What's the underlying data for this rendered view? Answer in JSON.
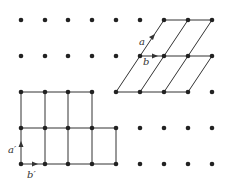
{
  "diagram": {
    "colors": {
      "dot": "#222222",
      "line": "#333333",
      "background": "#ffffff"
    },
    "grid": {
      "columns_x": [
        21,
        45,
        68,
        92,
        116,
        140,
        164,
        188,
        212
      ],
      "rows_y": [
        20,
        56,
        92,
        128,
        164
      ],
      "dot_radius": 2.3
    },
    "oblique_cell": {
      "labels": {
        "a": "a",
        "b": "b"
      },
      "horizontal_lines": [
        {
          "x1": 164,
          "y1": 20,
          "x2": 212,
          "y2": 20
        },
        {
          "x1": 140,
          "y1": 56,
          "x2": 212,
          "y2": 56
        },
        {
          "x1": 116,
          "y1": 92,
          "x2": 188,
          "y2": 92
        }
      ],
      "oblique_lines": [
        {
          "x1": 116,
          "y1": 92,
          "x2": 164,
          "y2": 20
        },
        {
          "x1": 140,
          "y1": 92,
          "x2": 188,
          "y2": 20
        },
        {
          "x1": 164,
          "y1": 92,
          "x2": 212,
          "y2": 20
        },
        {
          "x1": 188,
          "y1": 92,
          "x2": 212,
          "y2": 56
        }
      ]
    },
    "rectangular_cell": {
      "labels": {
        "a": "a′",
        "b": "b′"
      },
      "horizontal_lines": [
        {
          "x1": 21,
          "y1": 92,
          "x2": 92,
          "y2": 92
        },
        {
          "x1": 21,
          "y1": 128,
          "x2": 116,
          "y2": 128
        },
        {
          "x1": 21,
          "y1": 164,
          "x2": 116,
          "y2": 164
        }
      ],
      "vertical_lines": [
        {
          "x1": 21,
          "y1": 92,
          "x2": 21,
          "y2": 164
        },
        {
          "x1": 45,
          "y1": 92,
          "x2": 45,
          "y2": 164
        },
        {
          "x1": 68,
          "y1": 92,
          "x2": 68,
          "y2": 164
        },
        {
          "x1": 92,
          "y1": 92,
          "x2": 92,
          "y2": 164
        },
        {
          "x1": 116,
          "y1": 128,
          "x2": 116,
          "y2": 164
        }
      ]
    }
  }
}
